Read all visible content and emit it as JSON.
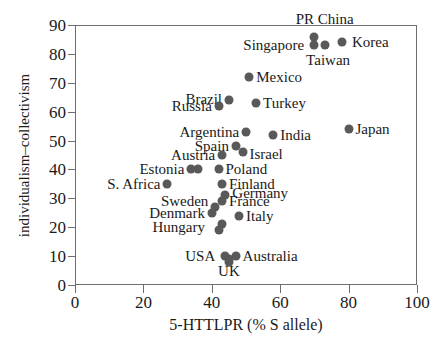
{
  "chart_data": {
    "type": "scatter",
    "title": "",
    "xlabel": "5-HTTLPR (% S allele)",
    "ylabel": "individualism–collectivism",
    "xlim": [
      0,
      100
    ],
    "ylim": [
      0,
      90
    ],
    "xticks": [
      0,
      20,
      40,
      60,
      80,
      100
    ],
    "yticks": [
      0,
      10,
      20,
      30,
      40,
      50,
      60,
      70,
      80,
      90
    ],
    "grid": false,
    "legend": "none",
    "marker_color": "#595959",
    "axis_color": "#6e6e6e",
    "points": [
      {
        "label": "PR China",
        "x": 70,
        "y": 86,
        "lx": 73,
        "ly": 92,
        "anchor": "c"
      },
      {
        "label": "Singapore",
        "x": 70,
        "y": 83,
        "lx": 67,
        "ly": 83,
        "anchor": "r"
      },
      {
        "label": "Taiwan",
        "x": 73,
        "y": 83,
        "lx": 74,
        "ly": 78,
        "anchor": "c"
      },
      {
        "label": "Korea",
        "x": 78,
        "y": 84,
        "lx": 81,
        "ly": 84,
        "anchor": "l"
      },
      {
        "label": "Mexico",
        "x": 51,
        "y": 72,
        "lx": 53,
        "ly": 72,
        "anchor": "l"
      },
      {
        "label": "Brazil",
        "x": 45,
        "y": 64,
        "lx": 43,
        "ly": 64.5,
        "anchor": "r"
      },
      {
        "label": "Russia",
        "x": 42,
        "y": 62,
        "lx": 40,
        "ly": 62,
        "anchor": "r"
      },
      {
        "label": "Turkey",
        "x": 53,
        "y": 63,
        "lx": 55,
        "ly": 63,
        "anchor": "l"
      },
      {
        "label": "Argentina",
        "x": 50,
        "y": 53,
        "lx": 48,
        "ly": 53,
        "anchor": "r"
      },
      {
        "label": "India",
        "x": 58,
        "y": 52,
        "lx": 60,
        "ly": 52,
        "anchor": "l"
      },
      {
        "label": "Japan",
        "x": 80,
        "y": 54,
        "lx": 82,
        "ly": 54,
        "anchor": "l"
      },
      {
        "label": "Spain",
        "x": 47,
        "y": 48,
        "lx": 45,
        "ly": 48,
        "anchor": "r"
      },
      {
        "label": "Austria",
        "x": 43,
        "y": 45,
        "lx": 41,
        "ly": 45,
        "anchor": "r"
      },
      {
        "label": "Israel",
        "x": 49,
        "y": 46,
        "lx": 51,
        "ly": 45.5,
        "anchor": "l"
      },
      {
        "label": "Estonia",
        "x": 34,
        "y": 40,
        "lx": 32,
        "ly": 40,
        "anchor": "r"
      },
      {
        "label": "Poland",
        "x": 42,
        "y": 40,
        "lx": 44,
        "ly": 40,
        "anchor": "l"
      },
      {
        "label": "S. Africa",
        "x": 27,
        "y": 35,
        "lx": 25,
        "ly": 35,
        "anchor": "r"
      },
      {
        "label": "Finland",
        "x": 43,
        "y": 35,
        "lx": 45,
        "ly": 35,
        "anchor": "l"
      },
      {
        "label": "Germany",
        "x": 44,
        "y": 31,
        "lx": 46,
        "ly": 32,
        "anchor": "l"
      },
      {
        "label": "France",
        "x": 43,
        "y": 29,
        "lx": 45,
        "ly": 29,
        "anchor": "l"
      },
      {
        "label": "Sweden",
        "x": 41,
        "y": 27,
        "lx": 39,
        "ly": 29,
        "anchor": "r"
      },
      {
        "label": "Denmark",
        "x": 40,
        "y": 25,
        "lx": 38,
        "ly": 25,
        "anchor": "r"
      },
      {
        "label": "Italy",
        "x": 48,
        "y": 24,
        "lx": 50,
        "ly": 24,
        "anchor": "l"
      },
      {
        "label": "Hungary",
        "x": 43,
        "y": 21,
        "lx": 38,
        "ly": 20,
        "anchor": "r"
      },
      {
        "label": "USA",
        "x": 44,
        "y": 10,
        "lx": 41,
        "ly": 10,
        "anchor": "r"
      },
      {
        "label": "Australia",
        "x": 47,
        "y": 10,
        "lx": 49,
        "ly": 10,
        "anchor": "l"
      },
      {
        "label": "UK",
        "x": 45,
        "y": 9,
        "lx": 45,
        "ly": 5,
        "anchor": "c"
      }
    ],
    "extra_markers": [
      {
        "name": "estonia-pair-right",
        "x": 36,
        "y": 40
      },
      {
        "name": "hungary-pair-lower",
        "x": 42,
        "y": 19
      },
      {
        "name": "usa-pair-lower",
        "x": 45,
        "y": 8
      }
    ]
  }
}
